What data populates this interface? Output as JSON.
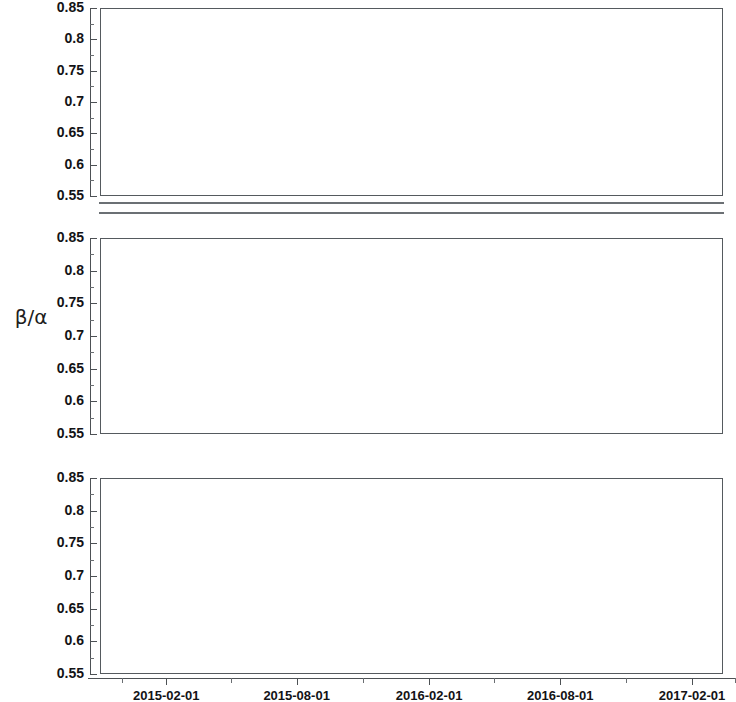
{
  "axis_title": "β/α",
  "reference_lines": [
    {
      "name": "upper",
      "value": 0.74,
      "color": "#aab4d6"
    },
    {
      "name": "lower",
      "value": 0.63,
      "color": "#f3cdb4"
    }
  ],
  "y_axis": {
    "min": 0.55,
    "max": 0.85,
    "ticks": [
      "0.85",
      "0.8",
      "0.75",
      "0.7",
      "0.65",
      "0.6",
      "0.55"
    ],
    "tick_values": [
      0.85,
      0.8,
      0.75,
      0.7,
      0.65,
      0.6,
      0.55
    ]
  },
  "x_axis": {
    "min": "2014-11-01",
    "max": "2017-03-15",
    "min_num": 2014.833,
    "max_num": 2017.203,
    "tick_labels": [
      "2015-02-01",
      "2015-08-01",
      "2016-02-01",
      "2016-08-01",
      "2017-02-01"
    ],
    "tick_values": [
      2015.085,
      2015.581,
      2016.085,
      2016.584,
      2017.085
    ],
    "minor_tick_values": [
      2014.917,
      2015.333,
      2015.833,
      2016.333,
      2016.833,
      2017.25
    ]
  },
  "chart_data": {
    "type": "scatter",
    "title": "",
    "xlabel": "",
    "ylabel": "β/α",
    "xlim": [
      2014.833,
      2017.203
    ],
    "ylim": [
      0.55,
      0.85
    ],
    "grid": false,
    "legend": "none",
    "panels": [
      {
        "label": "RAW",
        "annotations": [],
        "points": [
          {
            "x": 2015.07,
            "y": 0.623
          },
          {
            "x": 2015.1,
            "y": 0.633
          },
          {
            "x": 2015.12,
            "y": 0.622
          },
          {
            "x": 2015.2,
            "y": 0.637
          },
          {
            "x": 2015.3,
            "y": 0.623
          },
          {
            "x": 2015.4,
            "y": 0.626
          },
          {
            "x": 2015.47,
            "y": 0.629
          },
          {
            "x": 2015.5,
            "y": 0.627
          },
          {
            "x": 2015.56,
            "y": 0.634
          },
          {
            "x": 2015.64,
            "y": 0.624
          },
          {
            "x": 2015.66,
            "y": 0.626
          },
          {
            "x": 2015.68,
            "y": 0.631
          },
          {
            "x": 2015.7,
            "y": 0.628
          },
          {
            "x": 2015.73,
            "y": 0.627
          },
          {
            "x": 2015.76,
            "y": 0.631
          },
          {
            "x": 2015.78,
            "y": 0.63
          },
          {
            "x": 2015.8,
            "y": 0.629
          },
          {
            "x": 2015.82,
            "y": 0.631
          },
          {
            "x": 2015.85,
            "y": 0.63
          },
          {
            "x": 2015.93,
            "y": 0.629
          },
          {
            "x": 2015.99,
            "y": 0.628
          },
          {
            "x": 2016.02,
            "y": 0.627
          },
          {
            "x": 2016.09,
            "y": 0.623
          },
          {
            "x": 2016.11,
            "y": 0.625
          },
          {
            "x": 2016.22,
            "y": 0.632
          },
          {
            "x": 2016.33,
            "y": 0.624
          },
          {
            "x": 2016.35,
            "y": 0.626
          },
          {
            "x": 2016.56,
            "y": 0.62
          },
          {
            "x": 2016.66,
            "y": 0.628
          },
          {
            "x": 2016.68,
            "y": 0.63
          },
          {
            "x": 2016.7,
            "y": 0.629
          },
          {
            "x": 2016.8,
            "y": 0.643
          },
          {
            "x": 2016.88,
            "y": 0.678
          }
        ]
      },
      {
        "label": "FEED",
        "annotations": [
          {
            "text": "no dosing",
            "x": 2016.02,
            "y": 0.603
          },
          {
            "text": "very low\ndosing",
            "x": 2016.47,
            "y": 0.603
          }
        ],
        "points": [
          {
            "x": 2015.07,
            "y": 0.715
          },
          {
            "x": 2015.11,
            "y": 0.722
          },
          {
            "x": 2015.09,
            "y": 0.755
          },
          {
            "x": 2015.23,
            "y": 0.799
          },
          {
            "x": 2015.39,
            "y": 0.753
          },
          {
            "x": 2015.33,
            "y": 0.713
          },
          {
            "x": 2015.56,
            "y": 0.74
          },
          {
            "x": 2015.59,
            "y": 0.742
          },
          {
            "x": 2015.65,
            "y": 0.745
          },
          {
            "x": 2015.74,
            "y": 0.72
          },
          {
            "x": 2015.75,
            "y": 0.716
          },
          {
            "x": 2015.79,
            "y": 0.707
          },
          {
            "x": 2015.83,
            "y": 0.697
          },
          {
            "x": 2015.86,
            "y": 0.694
          },
          {
            "x": 2015.9,
            "y": 0.704
          },
          {
            "x": 2015.92,
            "y": 0.709
          },
          {
            "x": 2015.95,
            "y": 0.687
          },
          {
            "x": 2015.97,
            "y": 0.703
          },
          {
            "x": 2016.02,
            "y": 0.63
          },
          {
            "x": 2016.13,
            "y": 0.716
          },
          {
            "x": 2016.18,
            "y": 0.707
          },
          {
            "x": 2016.27,
            "y": 0.74
          },
          {
            "x": 2016.27,
            "y": 0.734
          },
          {
            "x": 2016.38,
            "y": 0.712
          },
          {
            "x": 2016.47,
            "y": 0.714
          },
          {
            "x": 2016.47,
            "y": 0.661
          },
          {
            "x": 2016.47,
            "y": 0.659
          },
          {
            "x": 2016.7,
            "y": 0.726
          },
          {
            "x": 2016.79,
            "y": 0.731
          },
          {
            "x": 2016.82,
            "y": 0.724
          },
          {
            "x": 2016.84,
            "y": 0.722
          },
          {
            "x": 2016.88,
            "y": 0.742
          },
          {
            "x": 2016.88,
            "y": 0.731
          },
          {
            "x": 2016.92,
            "y": 0.747
          },
          {
            "x": 2016.96,
            "y": 0.726
          },
          {
            "x": 2017.01,
            "y": 0.733
          }
        ]
      },
      {
        "label": "PERM",
        "annotations": [
          {
            "text": "no dosing",
            "x": 2016.02,
            "y": 0.603
          },
          {
            "text": "very low\ndosing",
            "x": 2016.47,
            "y": 0.603
          }
        ],
        "points": [
          {
            "x": 2015.09,
            "y": 0.732
          },
          {
            "x": 2015.11,
            "y": 0.745
          },
          {
            "x": 2015.13,
            "y": 0.721
          },
          {
            "x": 2015.25,
            "y": 0.75
          },
          {
            "x": 2015.36,
            "y": 0.764
          },
          {
            "x": 2015.46,
            "y": 0.729
          },
          {
            "x": 2015.55,
            "y": 0.738
          },
          {
            "x": 2015.59,
            "y": 0.752
          },
          {
            "x": 2015.65,
            "y": 0.741
          },
          {
            "x": 2015.75,
            "y": 0.738
          },
          {
            "x": 2015.79,
            "y": 0.724
          },
          {
            "x": 2015.83,
            "y": 0.721
          },
          {
            "x": 2015.87,
            "y": 0.719
          },
          {
            "x": 2015.92,
            "y": 0.712
          },
          {
            "x": 2015.93,
            "y": 0.71
          },
          {
            "x": 2015.95,
            "y": 0.711
          },
          {
            "x": 2015.97,
            "y": 0.727
          },
          {
            "x": 2016.0,
            "y": 0.718
          },
          {
            "x": 2016.02,
            "y": 0.63
          },
          {
            "x": 2016.13,
            "y": 0.727
          },
          {
            "x": 2016.19,
            "y": 0.73
          },
          {
            "x": 2016.2,
            "y": 0.729
          },
          {
            "x": 2016.27,
            "y": 0.722
          },
          {
            "x": 2016.38,
            "y": 0.719
          },
          {
            "x": 2016.47,
            "y": 0.722
          },
          {
            "x": 2016.47,
            "y": 0.655
          },
          {
            "x": 2016.67,
            "y": 0.737
          },
          {
            "x": 2016.78,
            "y": 0.719
          },
          {
            "x": 2016.79,
            "y": 0.718
          },
          {
            "x": 2016.82,
            "y": 0.751
          },
          {
            "x": 2016.82,
            "y": 0.726
          },
          {
            "x": 2016.86,
            "y": 0.735
          },
          {
            "x": 2016.9,
            "y": 0.737
          },
          {
            "x": 2016.94,
            "y": 0.752
          },
          {
            "x": 2017.0,
            "y": 0.73
          }
        ]
      }
    ]
  }
}
